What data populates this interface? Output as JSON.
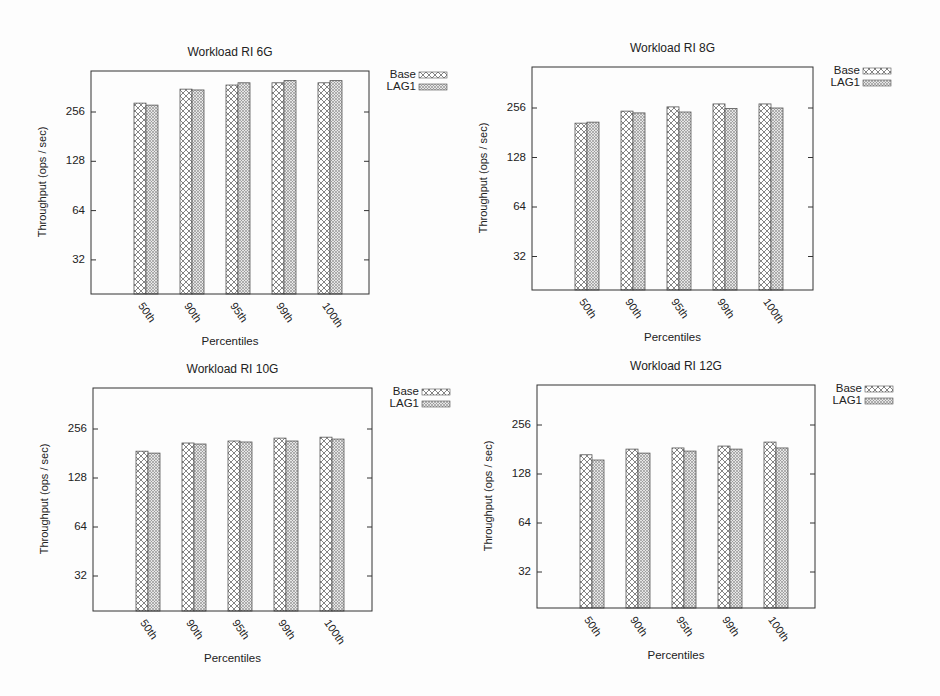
{
  "chart_data": [
    {
      "type": "bar",
      "title": "Workload RI 6G",
      "xlabel": "Percentiles",
      "ylabel": "Throughput (ops / sec)",
      "yscale": "log2",
      "yticks": [
        32,
        64,
        128,
        256
      ],
      "ylim": [
        16,
        512
      ],
      "grid": false,
      "legend_position": "outside top right",
      "categories": [
        "50th",
        "90th",
        "95th",
        "99th",
        "100th"
      ],
      "series": [
        {
          "name": "Base",
          "values": [
            290,
            353,
            374,
            386,
            386
          ]
        },
        {
          "name": "LAG1",
          "values": [
            282,
            349,
            386,
            398,
            398
          ]
        }
      ]
    },
    {
      "type": "bar",
      "title": "Workload RI 8G",
      "xlabel": "Percentiles",
      "ylabel": "Throughput (ops / sec)",
      "yscale": "log2",
      "yticks": [
        32,
        64,
        128,
        256
      ],
      "ylim": [
        16,
        512
      ],
      "grid": false,
      "legend_position": "outside top right",
      "categories": [
        "50th",
        "90th",
        "95th",
        "99th",
        "100th"
      ],
      "series": [
        {
          "name": "Base",
          "values": [
            207,
            245,
            260,
            271,
            271
          ]
        },
        {
          "name": "LAG1",
          "values": [
            210,
            239,
            242,
            254,
            256
          ]
        }
      ]
    },
    {
      "type": "bar",
      "title": "Workload RI 10G",
      "xlabel": "Percentiles",
      "ylabel": "Throughput (ops / sec)",
      "yscale": "log2",
      "yticks": [
        32,
        64,
        128,
        256
      ],
      "ylim": [
        16,
        512
      ],
      "grid": false,
      "legend_position": "outside top right",
      "categories": [
        "50th",
        "90th",
        "95th",
        "99th",
        "100th"
      ],
      "series": [
        {
          "name": "Base",
          "values": [
            187,
            210,
            216,
            225,
            228
          ]
        },
        {
          "name": "LAG1",
          "values": [
            182,
            207,
            213,
            216,
            222
          ]
        }
      ]
    },
    {
      "type": "bar",
      "title": "Workload RI 12G",
      "xlabel": "Percentiles",
      "ylabel": "Throughput (ops / sec)",
      "yscale": "log2",
      "yticks": [
        32,
        64,
        128,
        256
      ],
      "ylim": [
        16,
        512
      ],
      "grid": false,
      "legend_position": "outside top right",
      "categories": [
        "50th",
        "90th",
        "95th",
        "99th",
        "100th"
      ],
      "series": [
        {
          "name": "Base",
          "values": [
            168,
            182,
            185,
            190,
            201
          ]
        },
        {
          "name": "LAG1",
          "values": [
            156,
            172,
            177,
            182,
            185
          ]
        }
      ]
    }
  ],
  "panels": [
    {
      "title": "Workload RI 6G",
      "xlabel": "Percentiles",
      "ylabel": "Throughput (ops / sec)",
      "legend": [
        "Base",
        "LAG1"
      ],
      "ticks": [
        "256",
        "128",
        "64",
        "32"
      ],
      "cats": [
        "50th",
        "90th",
        "95th",
        "99th",
        "100th"
      ]
    },
    {
      "title": "Workload RI 8G",
      "xlabel": "Percentiles",
      "ylabel": "Throughput (ops / sec)",
      "legend": [
        "Base",
        "LAG1"
      ],
      "ticks": [
        "256",
        "128",
        "64",
        "32"
      ],
      "cats": [
        "50th",
        "90th",
        "95th",
        "99th",
        "100th"
      ]
    },
    {
      "title": "Workload RI 10G",
      "xlabel": "Percentiles",
      "ylabel": "Throughput (ops / sec)",
      "legend": [
        "Base",
        "LAG1"
      ],
      "ticks": [
        "256",
        "128",
        "64",
        "32"
      ],
      "cats": [
        "50th",
        "90th",
        "95th",
        "99th",
        "100th"
      ]
    },
    {
      "title": "Workload RI 12G",
      "xlabel": "Percentiles",
      "ylabel": "Throughput (ops / sec)",
      "legend": [
        "Base",
        "LAG1"
      ],
      "ticks": [
        "256",
        "128",
        "64",
        "32"
      ],
      "cats": [
        "50th",
        "90th",
        "95th",
        "99th",
        "100th"
      ]
    }
  ],
  "colors": {
    "axis": "#333333",
    "bar_stroke": "#555555",
    "hatch": "#666666",
    "background": "#fdfdfd"
  }
}
